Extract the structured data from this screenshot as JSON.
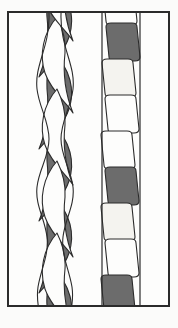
{
  "page": {
    "background_color": "#fbfbfa",
    "caption": ""
  },
  "frame": {
    "border_color": "#2b2b2b",
    "fill_color": "#fdfdfc",
    "x": 7,
    "y": 11,
    "width": 163,
    "height": 296
  },
  "palette": {
    "ink": "#2b2b2b",
    "dark_fill": "#6c6c6c",
    "light_fill": "#fdfdfc",
    "offwhite_fill": "#f4f3ef",
    "paper": "#fbfbfa"
  },
  "motifs": [
    {
      "id": "twisted-cable",
      "label": "Twisted cable border",
      "type": "two-strand twist",
      "position": "left",
      "x": 24,
      "width": 44,
      "segment_height": 36,
      "segment_count": 9,
      "fill_sequence": [
        "dark",
        "light",
        "dark",
        "light",
        "dark",
        "light",
        "dark",
        "light",
        "dark"
      ]
    },
    {
      "id": "plaited-band",
      "label": "Plaited band border",
      "type": "slanted strap plait",
      "position": "right",
      "x": 90,
      "width": 44,
      "segment_height": 36,
      "segment_count": 9,
      "fill_sequence": [
        "light",
        "dark",
        "offwhite",
        "light",
        "dark",
        "offwhite",
        "light",
        "dark",
        "offwhite"
      ]
    }
  ]
}
